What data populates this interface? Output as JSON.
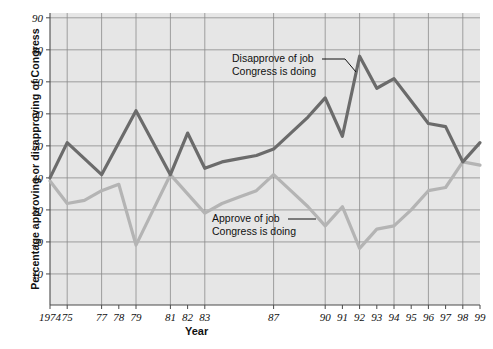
{
  "chart_data": {
    "type": "line",
    "title": "",
    "xlabel": "Year",
    "ylabel": "Percentage approving or disapproving of Congress",
    "ylim": [
      0,
      90
    ],
    "yticks": [
      10,
      20,
      30,
      40,
      50,
      60,
      70,
      80,
      90
    ],
    "grid": true,
    "legend_position": "annotations-inline",
    "x": [
      1974,
      1975,
      1976,
      1977,
      1978,
      1979,
      1980,
      1981,
      1982,
      1983,
      1984,
      1985,
      1986,
      1987,
      1988,
      1989,
      1990,
      1991,
      1992,
      1993,
      1994,
      1995,
      1996,
      1997,
      1998,
      1999
    ],
    "xtick_labels": [
      "1974",
      "75",
      "",
      "77",
      "78",
      "79",
      "",
      "81",
      "82",
      "83",
      "",
      "",
      "",
      "87",
      "",
      "",
      "90",
      "91",
      "92",
      "93",
      "94",
      "95",
      "96",
      "97",
      "98",
      "99"
    ],
    "series": [
      {
        "name": "Disapprove of job Congress is doing",
        "color": "#6b6b6b",
        "values": [
          40,
          51,
          46,
          41,
          51,
          61,
          51,
          41,
          54,
          43,
          45,
          46,
          47,
          49,
          54,
          59,
          65,
          53,
          78,
          68,
          71,
          64,
          57,
          56,
          45,
          51
        ]
      },
      {
        "name": "Approve of job Congress is doing",
        "color": "#b4b4b4",
        "values": [
          39,
          32,
          33,
          36,
          38,
          19,
          30,
          41,
          35,
          29,
          32,
          34,
          36,
          41,
          36,
          31,
          25,
          31,
          18,
          24,
          25,
          30,
          36,
          37,
          45,
          44
        ]
      }
    ],
    "annotations": [
      {
        "name": "disapprove-annotation",
        "line1": "Disapprove of job",
        "line2": "Congress is doing",
        "text_x": 232,
        "text_y": 62,
        "leader": [
          [
            322,
            59
          ],
          [
            345,
            59
          ],
          [
            356,
            72
          ]
        ]
      },
      {
        "name": "approve-annotation",
        "line1": "Approve of job",
        "line2": "Congress is doing",
        "text_x": 212,
        "text_y": 222,
        "leader": [
          [
            288,
            219
          ],
          [
            316,
            219
          ]
        ]
      }
    ],
    "colors": {
      "plot_background": "#e6e6e6",
      "grid": "#8a8a8a",
      "axis": "#4a4a4a",
      "text": "#111111",
      "disapprove": "#6b6b6b",
      "approve": "#b4b4b4"
    }
  }
}
